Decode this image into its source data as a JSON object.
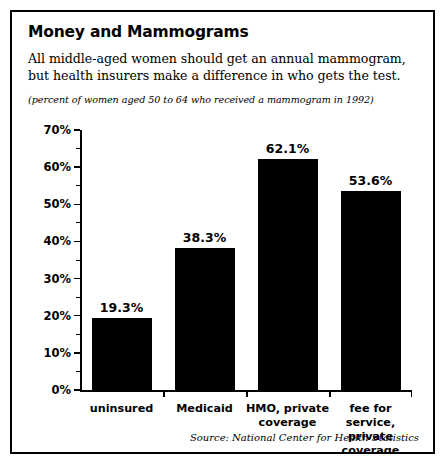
{
  "figure": {
    "title": "Money and Mammograms",
    "subtitle": "All middle-aged women should get an annual mammogram, but health insurers make a difference in who gets the test.",
    "units_note": "(percent of women aged 50 to 64 who received a mammogram in 1992)",
    "source": "Source: National Center for Health Statistics",
    "border_color": "#000000",
    "background_color": "#ffffff",
    "bar_color": "#000000"
  },
  "chart_data": {
    "type": "bar",
    "title": "Money and Mammograms",
    "subtitle": "All middle-aged women should get an annual mammogram, but health insurers make a difference in who gets the test.",
    "xlabel": "",
    "ylabel": "",
    "units": "(percent of women aged 50 to 64 who received a mammogram in 1992)",
    "categories": [
      "uninsured",
      "Medicaid",
      "HMO, private coverage",
      "fee for service, private coverage"
    ],
    "category_lines": [
      [
        "uninsured"
      ],
      [
        "Medicaid"
      ],
      [
        "HMO, private",
        "coverage"
      ],
      [
        "fee for service,",
        "private coverage"
      ]
    ],
    "values": [
      19.3,
      38.3,
      62.1,
      53.6
    ],
    "value_labels": [
      "19.3%",
      "38.3%",
      "62.1%",
      "53.6%"
    ],
    "ylim": [
      0,
      70
    ],
    "ytick_values": [
      0,
      10,
      20,
      30,
      40,
      50,
      60,
      70
    ],
    "ytick_labels": [
      "0%",
      "10%",
      "20%",
      "30%",
      "40%",
      "50%",
      "60%",
      "70%"
    ],
    "yminor_tick_values": [
      5,
      15,
      25,
      35,
      45,
      55,
      65
    ],
    "grid": false,
    "legend": false,
    "series_color": "#000000",
    "source": "Source: National Center for Health Statistics"
  }
}
